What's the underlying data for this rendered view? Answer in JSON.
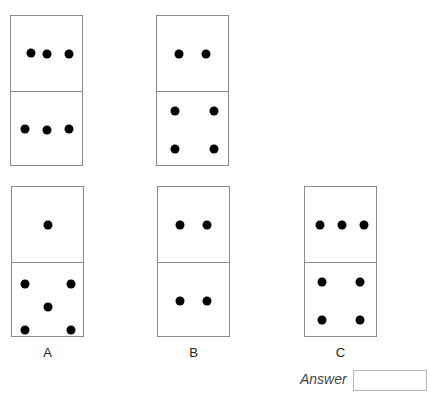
{
  "puzzle": {
    "sequence": [
      {
        "name": "domino-1",
        "top_dots": 3,
        "bottom_dots": 3
      },
      {
        "name": "domino-2",
        "top_dots": 2,
        "bottom_dots": 4
      }
    ],
    "options": [
      {
        "label": "A",
        "top_dots": 1,
        "bottom_dots": 5
      },
      {
        "label": "B",
        "top_dots": 2,
        "bottom_dots": 2
      },
      {
        "label": "C",
        "top_dots": 3,
        "bottom_dots": 4
      }
    ],
    "answer_label": "Answer",
    "answer_value": ""
  }
}
